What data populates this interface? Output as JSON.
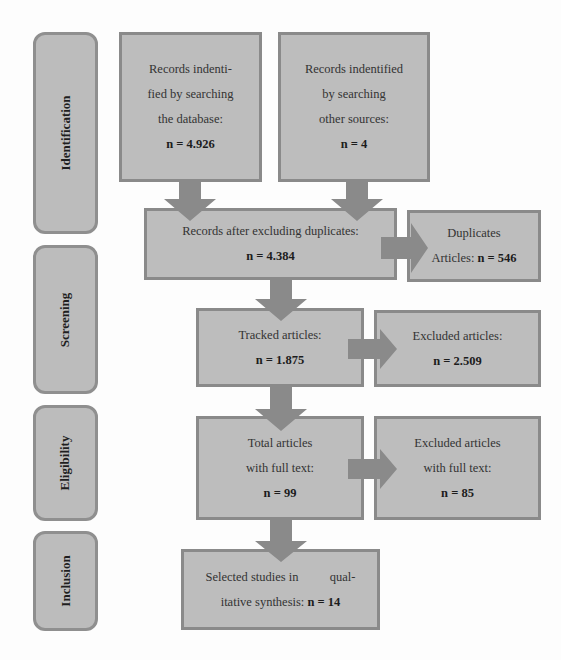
{
  "stages": [
    {
      "label": "Identification"
    },
    {
      "label": "Screening"
    },
    {
      "label": "Eligibility"
    },
    {
      "label": "Inclusion"
    }
  ],
  "boxes": {
    "database": {
      "lines": [
        "Records indenti-",
        "fied by searching",
        "the database:"
      ],
      "count": "n = 4.926"
    },
    "other_sources": {
      "lines": [
        "Records indentified",
        "by searching",
        "other sources:"
      ],
      "count": "n = 4"
    },
    "after_duplicates": {
      "lines": [
        "Records after excluding duplicates:"
      ],
      "count": "n = 4.384"
    },
    "duplicates": {
      "lines": [
        "Duplicates"
      ],
      "prefix": "Articles: ",
      "count": "n = 546"
    },
    "tracked": {
      "lines": [
        "Tracked articles:"
      ],
      "count": "n = 1.875"
    },
    "excluded": {
      "lines": [
        "Excluded articles:"
      ],
      "count": "n = 2.509"
    },
    "full_text": {
      "lines": [
        "Total articles",
        "with full text:"
      ],
      "count": "n = 99"
    },
    "excluded_full_text": {
      "lines": [
        "Excluded articles",
        "with full text:"
      ],
      "count": "n = 85"
    },
    "selected": {
      "lines": [
        "Selected studies in          qual-"
      ],
      "prefix": "itative synthesis: ",
      "count": "n = 14"
    }
  },
  "colors": {
    "box_fill": "#bdbdbd",
    "border": "#8a8a8a",
    "arrow": "#8a8a8a"
  }
}
